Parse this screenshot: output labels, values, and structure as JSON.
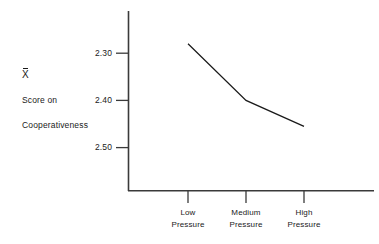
{
  "chart_data": {
    "type": "line",
    "title": "",
    "subtitle": "",
    "xlabel": "",
    "ylabel_lines": [
      "X̄",
      "Score on",
      "Cooperativeness"
    ],
    "categories": [
      "Low Pressure",
      "Medium Pressure",
      "High Pressure"
    ],
    "category_lines": [
      [
        "Low",
        "Pressure"
      ],
      [
        "Medium",
        "Pressure"
      ],
      [
        "High",
        "Pressure"
      ]
    ],
    "values": [
      2.28,
      2.4,
      2.455
    ],
    "series": [
      {
        "name": "Mean cooperativeness score",
        "values": [
          2.28,
          2.4,
          2.455
        ]
      }
    ],
    "ytick_labels": [
      "2.30",
      "2.40",
      "2.50"
    ],
    "ytick_values": [
      2.3,
      2.4,
      2.5
    ],
    "ylim": [
      2.2,
      2.58
    ],
    "y_axis_inverted": true,
    "grid": false,
    "legend": "none",
    "line_color": "#1a1a1a",
    "axis_color": "#3a3a3a",
    "background_color": "#ffffff"
  },
  "axis_caption": {
    "mean_symbol": "X",
    "line2": "Score on",
    "line3": "Cooperativeness"
  },
  "y_ticks": [
    {
      "label": "2.30"
    },
    {
      "label": "2.40"
    },
    {
      "label": "2.50"
    }
  ],
  "x_ticks": [
    {
      "line1": "Low",
      "line2": "Pressure"
    },
    {
      "line1": "Medium",
      "line2": "Pressure"
    },
    {
      "line1": "High",
      "line2": "Pressure"
    }
  ]
}
